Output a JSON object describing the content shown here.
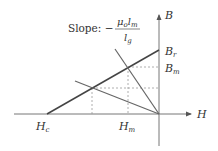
{
  "diagram": {
    "slope_label": {
      "prefix": "Slope: −",
      "numerator_mu": "μ",
      "numerator_mu_sub": "o",
      "numerator_l": "l",
      "numerator_l_sub": "m",
      "denominator_l": "l",
      "denominator_l_sub": "g"
    },
    "axes": {
      "x_label": "H",
      "y_label": "B"
    },
    "points": {
      "Br": {
        "label": "B",
        "sub": "r"
      },
      "Bm": {
        "label": "B",
        "sub": "m"
      },
      "Hc": {
        "label": "H",
        "sub": "c"
      },
      "Hm": {
        "label": "H",
        "sub": "m"
      }
    },
    "colors": {
      "line": "#555555",
      "axis": "#666666",
      "dashed": "#999999",
      "text": "#333333"
    }
  }
}
